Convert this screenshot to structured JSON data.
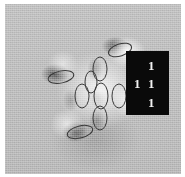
{
  "figure": {
    "type": "micrograph-with-annotations",
    "modality": "electron-microscopy-grayscale",
    "background_color": "#b9b9b9",
    "border_color": "#ffffff",
    "canvas": {
      "x": 5,
      "y": 4,
      "width": 176,
      "height": 170
    }
  },
  "index_plate": {
    "name": "miller-index-label",
    "background_color": "#0a0a0a",
    "text_color": "#f2f2f2",
    "digits": {
      "top": "1",
      "middle_left": "1",
      "middle_right": "1",
      "bottom": "1"
    },
    "reading": "111",
    "x": 126,
    "y": 51,
    "width": 43,
    "height": 64
  },
  "annotations": {
    "shape": "ellipse",
    "stroke_color": "#3a3a3a",
    "stroke_width": 1,
    "fill": "none",
    "count": 9,
    "ellipses": [
      {
        "id": "ellipse-upper-right",
        "cx": 115,
        "cy": 46,
        "rx": 12,
        "ry": 6,
        "rotation": -18,
        "orientation": "horizontal"
      },
      {
        "id": "ellipse-left",
        "cx": 56,
        "cy": 73,
        "rx": 13,
        "ry": 6,
        "rotation": -12,
        "orientation": "horizontal"
      },
      {
        "id": "ellipse-lower-left",
        "cx": 75,
        "cy": 128,
        "rx": 13,
        "ry": 6,
        "rotation": -14,
        "orientation": "horizontal"
      },
      {
        "id": "ellipse-center-top",
        "cx": 95,
        "cy": 65,
        "rx": 7,
        "ry": 12,
        "rotation": 0,
        "orientation": "vertical"
      },
      {
        "id": "ellipse-center-left",
        "cx": 77,
        "cy": 92,
        "rx": 7,
        "ry": 12,
        "rotation": 0,
        "orientation": "vertical"
      },
      {
        "id": "ellipse-center",
        "cx": 96,
        "cy": 92,
        "rx": 7,
        "ry": 13,
        "rotation": 0,
        "orientation": "vertical"
      },
      {
        "id": "ellipse-center-right",
        "cx": 114,
        "cy": 92,
        "rx": 7,
        "ry": 12,
        "rotation": 0,
        "orientation": "vertical"
      },
      {
        "id": "ellipse-center-bottom",
        "cx": 95,
        "cy": 114,
        "rx": 7,
        "ry": 12,
        "rotation": 0,
        "orientation": "vertical"
      },
      {
        "id": "ellipse-center-upper-left",
        "cx": 86,
        "cy": 78,
        "rx": 6,
        "ry": 11,
        "rotation": 0,
        "orientation": "vertical"
      }
    ]
  }
}
